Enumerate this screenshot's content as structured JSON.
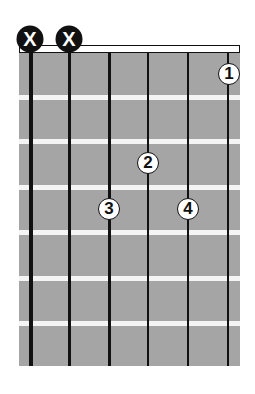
{
  "chord_diagram": {
    "strings": 6,
    "frets_shown": 7,
    "muted_strings": [
      {
        "string": 6,
        "label": "X"
      },
      {
        "string": 5,
        "label": "X"
      }
    ],
    "fingers": [
      {
        "finger": "1",
        "string": 1,
        "fret": 1
      },
      {
        "finger": "2",
        "string": 3,
        "fret": 3
      },
      {
        "finger": "3",
        "string": 4,
        "fret": 4
      },
      {
        "finger": "4",
        "string": 2,
        "fret": 4
      }
    ],
    "colors": {
      "board": "#a5a5a5",
      "fret": "#f4f4f4",
      "string": "#111111",
      "mute_fill": "#111111",
      "finger_fill": "#ffffff"
    }
  }
}
